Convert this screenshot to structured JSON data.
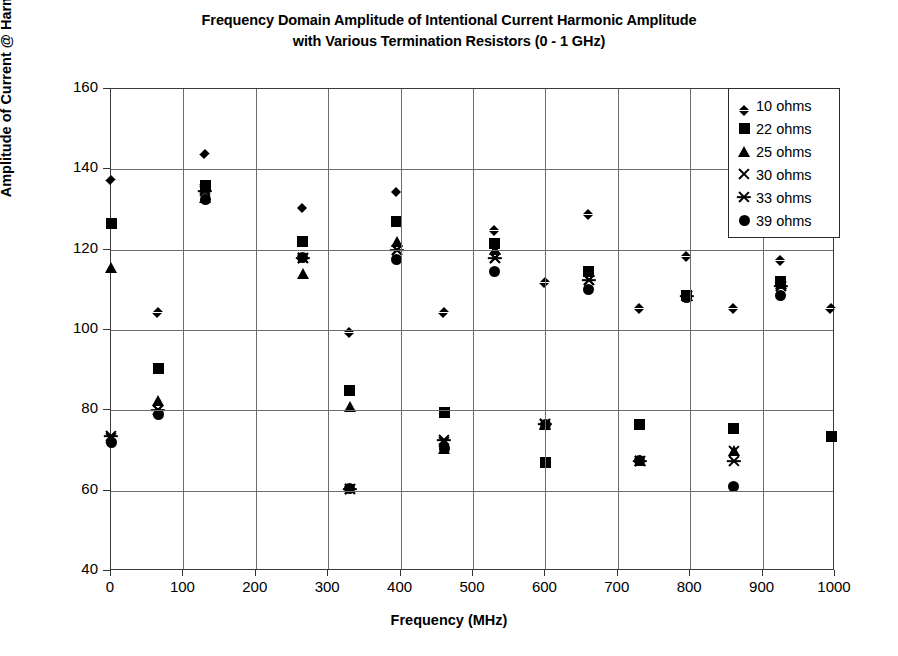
{
  "chart_data": {
    "type": "scatter",
    "title": "Frequency Domain Amplitude of Intentional Current Harmonic Amplitude with Various Termination Resistors (0 - 1 GHz)",
    "title_lines": [
      "Frequency Domain Amplitude of Intentional Current Harmonic Amplitude",
      "with Various Termination Resistors (0 - 1 GHz)"
    ],
    "xlabel": "Frequency (MHz)",
    "ylabel": "Amplitude of Current @ Harmonics (dBuA)",
    "xlim": [
      0,
      1000
    ],
    "ylim": [
      40,
      160
    ],
    "xticks": [
      0,
      100,
      200,
      300,
      400,
      500,
      600,
      700,
      800,
      900,
      1000
    ],
    "yticks": [
      40,
      60,
      80,
      100,
      120,
      140,
      160
    ],
    "grid": true,
    "legend_position": "top-right",
    "marker_color": "#000000",
    "series": [
      {
        "name": "10 ohms",
        "marker": "diamond",
        "x": [
          0,
          65,
          130,
          265,
          330,
          395,
          460,
          530,
          600,
          660,
          730,
          795,
          860,
          925,
          995
        ],
        "y": [
          138.5,
          105.5,
          145.0,
          131.5,
          100.5,
          135.5,
          105.5,
          126.0,
          113.0,
          130.0,
          106.5,
          119.5,
          106.5,
          118.5,
          106.5
        ]
      },
      {
        "name": "22 ohms",
        "marker": "square",
        "x": [
          0,
          65,
          130,
          265,
          330,
          395,
          460,
          530,
          600,
          660,
          730,
          795,
          860,
          925,
          995
        ],
        "y": [
          126.5,
          90.5,
          136.0,
          122.0,
          85.0,
          127.0,
          79.5,
          121.5,
          67.0,
          114.5,
          76.5,
          108.5,
          75.5,
          112.0,
          73.5
        ]
      },
      {
        "name": "25 ohms",
        "marker": "triangle",
        "x": [
          0,
          65,
          130,
          265,
          330,
          395,
          460,
          530,
          600,
          660,
          730,
          795,
          860,
          925
        ],
        "y": [
          115.5,
          82.5,
          133.0,
          114.0,
          81.0,
          122.0,
          70.5,
          120.0,
          76.5,
          114.5,
          67.5,
          108.5,
          70.0,
          111.5
        ]
      },
      {
        "name": "30 ohms",
        "marker": "x",
        "x": [
          0,
          65,
          130,
          265,
          330,
          395,
          460,
          530,
          600,
          660,
          730,
          795,
          860,
          925
        ],
        "y": [
          73.0,
          80.0,
          135.0,
          118.0,
          60.5,
          120.0,
          72.0,
          118.0,
          76.5,
          112.5,
          67.5,
          108.5,
          70.0,
          111.0
        ]
      },
      {
        "name": "33 ohms",
        "marker": "star",
        "x": [
          0,
          65,
          130,
          265,
          330,
          395,
          460,
          530,
          600,
          660,
          730,
          795,
          860,
          925
        ],
        "y": [
          73.5,
          80.0,
          134.5,
          118.0,
          60.5,
          120.0,
          72.5,
          118.0,
          76.5,
          112.5,
          67.5,
          108.5,
          67.5,
          111.0
        ]
      },
      {
        "name": "39 ohms",
        "marker": "circle",
        "x": [
          0,
          65,
          130,
          265,
          330,
          395,
          460,
          530,
          600,
          660,
          730,
          795,
          860,
          925
        ],
        "y": [
          72.0,
          79.0,
          132.5,
          118.0,
          60.5,
          117.5,
          70.5,
          114.5,
          76.5,
          110.0,
          67.5,
          108.0,
          61.0,
          108.5
        ]
      }
    ]
  },
  "legend": {
    "items": [
      {
        "label": "10 ohms",
        "marker": "diamond"
      },
      {
        "label": "22 ohms",
        "marker": "square"
      },
      {
        "label": "25 ohms",
        "marker": "triangle"
      },
      {
        "label": "30 ohms",
        "marker": "x"
      },
      {
        "label": "33 ohms",
        "marker": "star"
      },
      {
        "label": "39 ohms",
        "marker": "circle"
      }
    ]
  }
}
